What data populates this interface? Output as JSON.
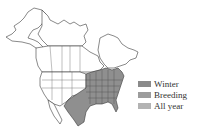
{
  "map": {
    "title": "Range map",
    "region": "North America",
    "shaded_region": "Eastern United States, Texas and northeastern Mexico"
  },
  "legend": {
    "items": [
      {
        "label": "Winter",
        "color": "#8a8a8a"
      },
      {
        "label": "Breeding",
        "color": "#9c9c9c"
      },
      {
        "label": "All year",
        "color": "#b3b3b3"
      }
    ]
  },
  "colors": {
    "outline": "#3a3a3a",
    "land": "#ffffff",
    "range_fill": "#8f8f8f"
  }
}
